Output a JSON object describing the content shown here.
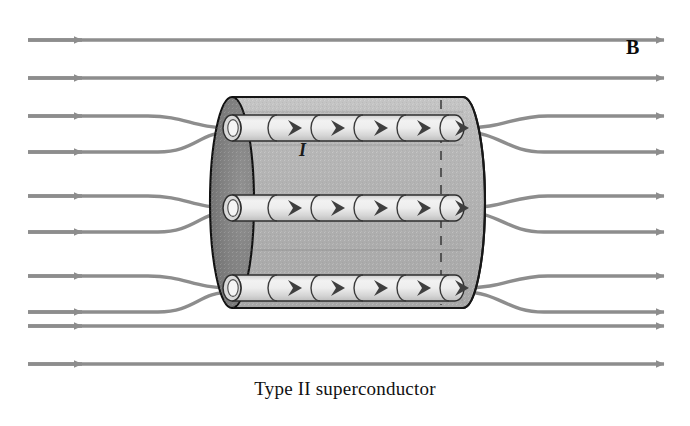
{
  "figure": {
    "caption": "Type II superconductor",
    "field_label": "B",
    "current_label": "I",
    "colors": {
      "field_line": "#8d8d8d",
      "body_fill": "#b4b4b4",
      "body_stroke": "#1c1c1c",
      "end_cap_dark": "#8a8a8a",
      "vortex_fill": "#e6e6e6",
      "vortex_stroke": "#3a3a3a",
      "background": "#ffffff",
      "text": "#111111"
    },
    "geometry": {
      "canvas_width": 690,
      "canvas_height": 426,
      "cylinder_left_x": 232,
      "cylinder_right_x": 463,
      "cylinder_top_y": 97,
      "cylinder_bottom_y": 308,
      "end_cap_rx": 22,
      "vortex_tube_y": [
        128,
        208,
        288
      ],
      "vortex_tube_height": 26,
      "arrows_per_tube": 5
    },
    "field_lines": {
      "count_left": 10,
      "count_right": 10,
      "straight_line_y": [
        40,
        78,
        326,
        364
      ],
      "bundled_pairs_y": [
        [
          116,
          152
        ],
        [
          196,
          232
        ],
        [
          276,
          312
        ]
      ],
      "left_start_x": 28,
      "right_end_x": 668
    }
  }
}
